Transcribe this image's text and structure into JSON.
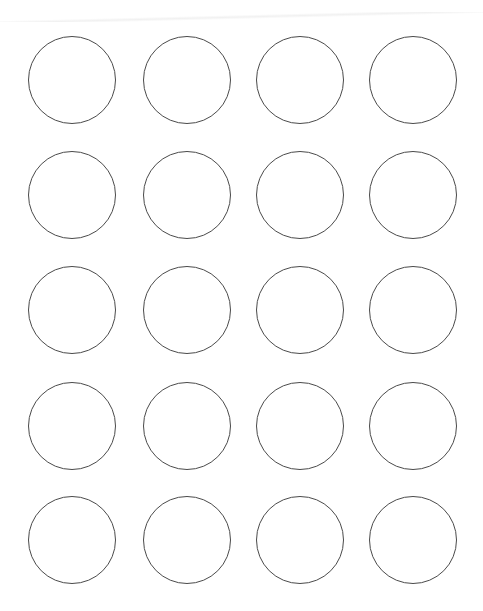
{
  "sheet": {
    "type": "round-label-template",
    "columns": 4,
    "rows": 5,
    "circle_diameter": 88,
    "column_centers_x": [
      72,
      187,
      300,
      413
    ],
    "row_centers_y": [
      80,
      195,
      310,
      426,
      540
    ],
    "stroke_color": "#4a4a4a",
    "background": "#ffffff"
  }
}
